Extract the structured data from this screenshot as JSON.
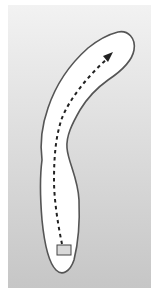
{
  "diagram": {
    "type": "golf-hole-layout",
    "shape": "dogleg-right fairway",
    "elements": [
      {
        "name": "background-panel",
        "description": "gray gradient panel"
      },
      {
        "name": "fairway",
        "description": "curved white fairway outline"
      },
      {
        "name": "shot-path",
        "description": "dashed line with arrowhead from tee to green"
      },
      {
        "name": "tee-box",
        "description": "small gray rectangle at bottom"
      }
    ],
    "colors": {
      "panel_top": "#f0f0f0",
      "panel_bottom": "#c8c8c8",
      "fairway_fill": "#ffffff",
      "outline": "#555555",
      "path": "#222222",
      "tee_fill": "#d9d9d9"
    }
  }
}
